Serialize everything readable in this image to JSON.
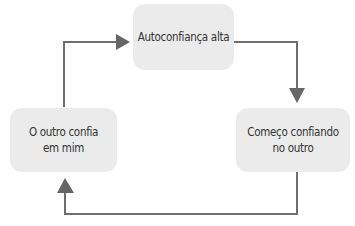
{
  "diagram": {
    "type": "cycle",
    "nodes": [
      {
        "id": "top",
        "label": "Autoconfiança alta"
      },
      {
        "id": "right",
        "label": "Começo confiando no outro",
        "lines": [
          "Começo confiando",
          "no outro"
        ]
      },
      {
        "id": "left",
        "label": "O outro confia em mim",
        "lines": [
          "O outro confia",
          "em mim"
        ]
      }
    ],
    "edges": [
      {
        "from": "top",
        "to": "right"
      },
      {
        "from": "right",
        "to": "left"
      },
      {
        "from": "left",
        "to": "top"
      }
    ],
    "colors": {
      "box": "#ebebeb",
      "arrow": "#666666",
      "text": "#333333"
    }
  }
}
